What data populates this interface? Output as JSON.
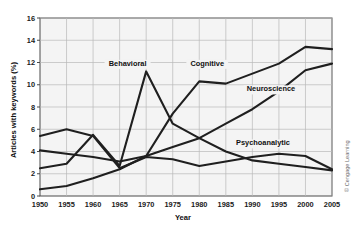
{
  "chart_data": {
    "type": "line",
    "title": "",
    "xlabel": "Year",
    "ylabel": "Articles with keywords (%)",
    "x": [
      1950,
      1955,
      1960,
      1965,
      1970,
      1975,
      1980,
      1985,
      1990,
      1995,
      2000,
      2005
    ],
    "xlim": [
      1950,
      2005
    ],
    "ylim": [
      0,
      16
    ],
    "ytick_values": [
      0,
      2,
      4,
      6,
      8,
      10,
      12,
      14,
      16
    ],
    "ytick_labels": [
      "0",
      "2",
      "4",
      "6",
      "8",
      "10",
      "12",
      "14",
      "16"
    ],
    "xtick_labels": [
      "1950",
      "1955",
      "1960",
      "1965",
      "1970",
      "1975",
      "1980",
      "1985",
      "1990",
      "1995",
      "2000",
      "2005"
    ],
    "grid": true,
    "legend_position": "inline-labels",
    "series": [
      {
        "name": "Behavioral",
        "values": [
          2.5,
          2.9,
          5.5,
          2.7,
          11.2,
          6.5,
          5.2,
          4.0,
          3.2,
          2.9,
          2.6,
          2.3
        ],
        "label_x": 1966.5,
        "label_y": 11.7
      },
      {
        "name": "Cognitive",
        "values": [
          0.6,
          0.9,
          1.6,
          2.4,
          3.6,
          7.4,
          10.3,
          10.1,
          11.0,
          11.9,
          13.4,
          13.2
        ],
        "label_x": 1981.5,
        "label_y": 11.7
      },
      {
        "name": "Neuroscience",
        "values": [
          4.1,
          3.8,
          3.5,
          3.1,
          3.6,
          4.4,
          5.2,
          6.5,
          7.8,
          9.4,
          11.3,
          11.9
        ],
        "label_x": 1993.5,
        "label_y": 9.4
      },
      {
        "name": "Psychoanalytic",
        "values": [
          5.4,
          6.0,
          5.4,
          2.5,
          3.5,
          3.3,
          2.7,
          3.1,
          3.5,
          3.8,
          3.6,
          2.4
        ],
        "label_x": 1992.0,
        "label_y": 4.55
      }
    ],
    "credit": "© Cengage Learning",
    "colors": {
      "line": "#1f1f1f",
      "grid": "#b9b9b9",
      "plot_background": "#f4f4f4",
      "frame": "#4a4a4a",
      "text": "#111111"
    }
  }
}
